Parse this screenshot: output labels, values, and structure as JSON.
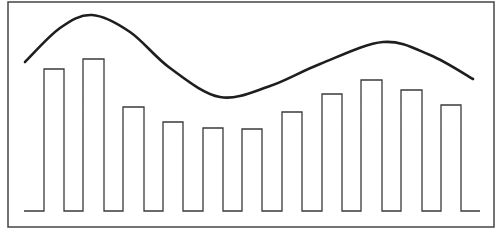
{
  "chart_data": {
    "type": "bar",
    "title": "",
    "xlabel": "",
    "ylabel": "",
    "grid": false,
    "legend": null,
    "bar_style": "outline (square-wave stepped baseline)",
    "categories": [
      "1",
      "2",
      "3",
      "4",
      "5",
      "6",
      "7",
      "8",
      "9",
      "10",
      "11"
    ],
    "values": [
      142,
      152,
      104,
      89,
      83,
      82,
      99,
      117,
      131,
      121,
      107
    ],
    "overlay_curve": {
      "type": "line",
      "smooth": true,
      "description": "smooth wave: high peak near bar 2, trough near bar 5, second peak near bar 9",
      "points": [
        [
          25,
          62
        ],
        [
          60,
          28
        ],
        [
          92,
          15
        ],
        [
          130,
          32
        ],
        [
          170,
          68
        ],
        [
          220,
          97
        ],
        [
          270,
          86
        ],
        [
          320,
          64
        ],
        [
          383,
          42
        ],
        [
          430,
          55
        ],
        [
          473,
          79
        ]
      ]
    }
  },
  "frame": {
    "left": 8,
    "top": 2,
    "right": 494,
    "bottom": 227
  },
  "baseline": {
    "y": 211,
    "x_start": 24,
    "x_end": 480
  },
  "bars": [
    {
      "x0": 44,
      "x1": 64,
      "top": 69
    },
    {
      "x0": 83,
      "x1": 104,
      "top": 59
    },
    {
      "x0": 123,
      "x1": 144,
      "top": 107
    },
    {
      "x0": 163,
      "x1": 183,
      "top": 122
    },
    {
      "x0": 203,
      "x1": 223,
      "top": 128
    },
    {
      "x0": 242,
      "x1": 262,
      "top": 129
    },
    {
      "x0": 282,
      "x1": 302,
      "top": 112
    },
    {
      "x0": 322,
      "x1": 342,
      "top": 94
    },
    {
      "x0": 361,
      "x1": 382,
      "top": 80
    },
    {
      "x0": 401,
      "x1": 422,
      "top": 90
    },
    {
      "x0": 441,
      "x1": 461,
      "top": 105
    }
  ],
  "colors": {
    "stroke": "#3a3a3a",
    "curve": "#1e1e1e",
    "frame": "#444444",
    "background": "#ffffff"
  }
}
